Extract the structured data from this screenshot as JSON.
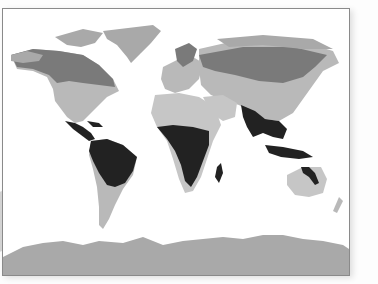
{
  "map": {
    "type": "world-climate-zones",
    "projection": "equirectangular",
    "colors": {
      "ocean": "#ffffff",
      "polar": "#a9a9a9",
      "boreal": "#7a7a7a",
      "temperate": "#b9b9b9",
      "arid": "#c6c6c6",
      "tropical": "#222222",
      "frame": "#8a8a8a"
    },
    "zones": [
      "polar",
      "boreal",
      "temperate",
      "arid",
      "tropical"
    ]
  }
}
